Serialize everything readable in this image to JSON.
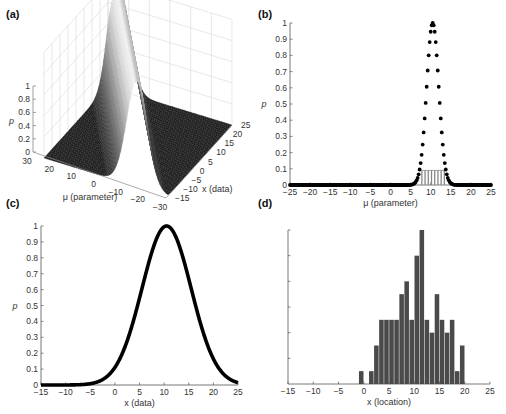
{
  "panels": {
    "a": {
      "label": "(a)"
    },
    "b": {
      "label": "(b)"
    },
    "c": {
      "label": "(c)"
    },
    "d": {
      "label": "(d)"
    }
  },
  "chart_data": [
    {
      "id": "a",
      "type": "surface",
      "title": "",
      "zlabel": "p",
      "xlabel": "μ (parameter)",
      "ylabel": "x (data)",
      "z_ticks": [
        "0",
        "0.2",
        "0.4",
        "0.6",
        "0.8",
        "1"
      ],
      "mu_ticks": [
        "30",
        "20",
        "10",
        "0",
        "−10",
        "−20",
        "−30"
      ],
      "x_ticks": [
        "−15",
        "−10",
        "−5",
        "0",
        "5",
        "10",
        "15",
        "20",
        "25"
      ],
      "mu_range": [
        -30,
        30
      ],
      "x_range": [
        -15,
        25
      ],
      "zlim": [
        0,
        1
      ],
      "description": "Gaussian ridge p(x|μ) along the diagonal x = μ, peak height 1",
      "grid": true
    },
    {
      "id": "b",
      "type": "scatter",
      "xlabel": "μ (parameter)",
      "ylabel": "p",
      "xlim": [
        -25,
        25
      ],
      "ylim": [
        0,
        1
      ],
      "x_ticks": [
        "−25",
        "−20",
        "−15",
        "−10",
        "−5",
        "0",
        "5",
        "10",
        "15",
        "20",
        "25"
      ],
      "y_ticks": [
        "0",
        "0.1",
        "0.2",
        "0.3",
        "0.4",
        "0.5",
        "0.6",
        "0.7",
        "0.8",
        "0.9",
        "1"
      ],
      "series": [
        {
          "name": "likelihood",
          "kind": "dots",
          "center": 10.5,
          "sigma": 1.5,
          "peak": 1.0,
          "step": 0.25,
          "color": "#000000"
        },
        {
          "name": "stems",
          "kind": "stems",
          "x": [
            7.8,
            8.6,
            9.4,
            10.2,
            11.0,
            11.8,
            12.6,
            13.4
          ],
          "values": [
            0.09,
            0.09,
            0.09,
            0.09,
            0.09,
            0.09,
            0.09,
            0.09
          ],
          "color": "#888888"
        }
      ]
    },
    {
      "id": "c",
      "type": "line",
      "xlabel": "x (data)",
      "ylabel": "p",
      "xlim": [
        -15,
        25
      ],
      "ylim": [
        0,
        1
      ],
      "x_ticks": [
        "−15",
        "−10",
        "−5",
        "0",
        "5",
        "10",
        "15",
        "20",
        "25"
      ],
      "y_ticks": [
        "0",
        "0.1",
        "0.2",
        "0.3",
        "0.4",
        "0.5",
        "0.6",
        "0.7",
        "0.8",
        "0.9",
        "1"
      ],
      "series": [
        {
          "name": "gaussian",
          "center": 10.5,
          "sigma": 5.0,
          "peak": 1.0,
          "color": "#000000"
        }
      ]
    },
    {
      "id": "d",
      "type": "bar",
      "xlabel": "x (location)",
      "ylabel": "",
      "xlim": [
        -15,
        25
      ],
      "ylim": [
        0,
        12
      ],
      "x_ticks": [
        "−15",
        "−10",
        "−5",
        "0",
        "5",
        "10",
        "15",
        "20",
        "25"
      ],
      "y_tick_count": 6,
      "y_tick_labels_shown": false,
      "bin_width": 0.9,
      "categories": [
        -0.5,
        1.5,
        2.5,
        3.5,
        4.5,
        5.5,
        6.5,
        7.5,
        8.5,
        9.5,
        10.5,
        11.5,
        12.5,
        13.5,
        14.5,
        15.5,
        16.5,
        17.5,
        18.5,
        19.5
      ],
      "values": [
        1,
        1,
        3,
        5,
        5,
        5,
        5,
        7,
        8,
        5,
        10,
        12,
        5,
        4,
        7,
        5,
        4,
        5,
        1,
        3
      ],
      "color": "#4a4a4a"
    }
  ]
}
